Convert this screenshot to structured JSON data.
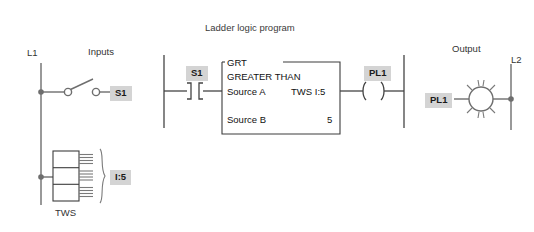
{
  "diagram": {
    "title": "Ladder logic program",
    "sections": {
      "inputs_label": "Inputs",
      "output_label": "Output"
    },
    "field_wiring": {
      "rail_left_label": "L1",
      "rail_right_label": "L2",
      "switch_tag": "S1",
      "thumbwheel_label": "TWS",
      "thumbwheel_address": "I:5",
      "lamp_tag": "PL1"
    },
    "rung": {
      "contact_tag": "S1",
      "coil_tag": "PL1",
      "instruction": {
        "mnemonic": "GRT",
        "name": "GREATER THAN",
        "operands": [
          {
            "label": "Source  A",
            "value": "TWS  I:5"
          },
          {
            "label": "Source  B",
            "value": "5"
          }
        ]
      }
    },
    "colors": {
      "background": "#ffffff",
      "wire": "#6e6e6e",
      "box_outline": "#3c3c3c",
      "tag_background": "#d4d4d4",
      "text": "#1a1a1a"
    }
  }
}
